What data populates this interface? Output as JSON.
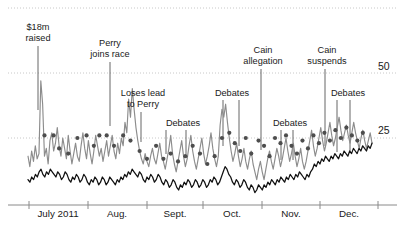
{
  "chart_data": {
    "type": "line",
    "title": "",
    "subtitle": "",
    "xlabel": "",
    "ylabel": "",
    "xlim": [
      0,
      186
    ],
    "ylim": [
      0,
      60
    ],
    "grid": true,
    "legend_position": "none",
    "x_tick_labels": [
      "July 2011",
      "Aug.",
      "Sept.",
      "Oct.",
      "Nov.",
      "Dec."
    ],
    "x_tick_positions_px": [
      29,
      88,
      147,
      203,
      262,
      320,
      378
    ],
    "y_tick_labels": [
      "50",
      "25"
    ],
    "y_tick_values": [
      50,
      25
    ],
    "gridlines": [
      75,
      50,
      25
    ],
    "colors": {
      "series_gray": "#8c8c8c",
      "series_black": "#111111",
      "dots": "#4d4d4d",
      "gridline": "#c8c8c8",
      "axis": "#8a8a8a",
      "leader": "#555555",
      "text": "#1a1a1a"
    },
    "series": [
      {
        "name": "gray-volatile-line",
        "color": "#8c8c8c",
        "style": "line",
        "values": [
          18,
          14,
          20,
          16,
          22,
          17,
          19,
          47,
          38,
          18,
          21,
          15,
          24,
          27,
          20,
          23,
          29,
          22,
          18,
          25,
          21,
          17,
          26,
          20,
          15,
          19,
          23,
          18,
          16,
          22,
          27,
          21,
          17,
          24,
          19,
          15,
          20,
          26,
          22,
          18,
          21,
          16,
          20,
          24,
          18,
          22,
          26,
          20,
          17,
          23,
          19,
          25,
          22,
          31,
          27,
          40,
          33,
          44,
          36,
          29,
          24,
          20,
          17,
          15,
          19,
          16,
          14,
          18,
          21,
          17,
          15,
          19,
          23,
          18,
          16,
          13,
          17,
          21,
          26,
          19,
          15,
          12,
          16,
          20,
          24,
          18,
          14,
          17,
          22,
          26,
          20,
          16,
          13,
          17,
          21,
          25,
          19,
          15,
          18,
          22,
          27,
          21,
          17,
          14,
          18,
          30,
          36,
          33,
          38,
          31,
          25,
          20,
          16,
          19,
          23,
          18,
          14,
          17,
          21,
          16,
          13,
          17,
          20,
          15,
          12,
          9,
          13,
          16,
          12,
          9,
          13,
          17,
          20,
          16,
          13,
          17,
          21,
          18,
          14,
          17,
          21,
          25,
          20,
          16,
          19,
          23,
          18,
          14,
          17,
          21,
          16,
          13,
          16,
          20,
          24,
          28,
          22,
          18,
          21,
          25,
          29,
          24,
          20,
          23,
          27,
          31,
          26,
          22,
          25,
          29,
          33,
          28,
          24,
          27,
          30,
          26,
          23,
          27,
          31,
          27,
          24,
          21,
          25,
          28,
          24,
          21,
          24,
          27,
          23
        ]
      },
      {
        "name": "black-line",
        "color": "#111111",
        "style": "line",
        "values": [
          9,
          8,
          10,
          9,
          11,
          10,
          12,
          13,
          11,
          10,
          12,
          11,
          13,
          12,
          11,
          10,
          12,
          11,
          9,
          10,
          12,
          11,
          9,
          8,
          10,
          9,
          11,
          10,
          8,
          9,
          11,
          10,
          8,
          7,
          9,
          8,
          10,
          9,
          7,
          8,
          10,
          9,
          7,
          8,
          10,
          9,
          8,
          7,
          9,
          8,
          10,
          9,
          11,
          10,
          12,
          11,
          13,
          12,
          11,
          10,
          12,
          11,
          9,
          8,
          10,
          9,
          11,
          10,
          8,
          9,
          11,
          10,
          8,
          7,
          9,
          8,
          6,
          7,
          9,
          8,
          6,
          5,
          7,
          6,
          8,
          7,
          9,
          8,
          6,
          7,
          9,
          8,
          6,
          7,
          9,
          8,
          6,
          7,
          9,
          8,
          10,
          9,
          7,
          8,
          10,
          12,
          14,
          13,
          11,
          10,
          8,
          7,
          9,
          8,
          6,
          7,
          9,
          8,
          6,
          5,
          7,
          6,
          4,
          5,
          7,
          6,
          5,
          7,
          6,
          8,
          7,
          9,
          8,
          7,
          9,
          8,
          10,
          9,
          8,
          10,
          9,
          11,
          10,
          9,
          11,
          10,
          12,
          11,
          10,
          9,
          11,
          10,
          12,
          13,
          15,
          14,
          16,
          15,
          17,
          16,
          18,
          17,
          16,
          18,
          17,
          19,
          18,
          17,
          19,
          18,
          20,
          19,
          18,
          20,
          19,
          21,
          20,
          19,
          21,
          20,
          22,
          21,
          20,
          22,
          21,
          23
        ]
      },
      {
        "name": "poll-dots",
        "color": "#4d4d4d",
        "style": "scatter",
        "points": [
          [
            9,
            26
          ],
          [
            14,
            26
          ],
          [
            17,
            21
          ],
          [
            22,
            19
          ],
          [
            27,
            25
          ],
          [
            32,
            26
          ],
          [
            36,
            22
          ],
          [
            39,
            26
          ],
          [
            43,
            26
          ],
          [
            47,
            22
          ],
          [
            52,
            26
          ],
          [
            56,
            24
          ],
          [
            61,
            20
          ],
          [
            65,
            17
          ],
          [
            70,
            22
          ],
          [
            74,
            17
          ],
          [
            78,
            19
          ],
          [
            82,
            16
          ],
          [
            86,
            18
          ],
          [
            90,
            22
          ],
          [
            94,
            19
          ],
          [
            98,
            15
          ],
          [
            102,
            18
          ],
          [
            106,
            25
          ],
          [
            110,
            27
          ],
          [
            113,
            23
          ],
          [
            116,
            20
          ],
          [
            119,
            25
          ],
          [
            122,
            19
          ],
          [
            126,
            24
          ],
          [
            129,
            22
          ],
          [
            132,
            18
          ],
          [
            135,
            25
          ],
          [
            138,
            23
          ],
          [
            141,
            26
          ],
          [
            144,
            22
          ],
          [
            147,
            19
          ],
          [
            150,
            24
          ],
          [
            153,
            21
          ],
          [
            156,
            26
          ],
          [
            159,
            23
          ],
          [
            162,
            27
          ],
          [
            165,
            24
          ],
          [
            168,
            28
          ],
          [
            171,
            25
          ],
          [
            174,
            29
          ],
          [
            177,
            26
          ],
          [
            180,
            24
          ],
          [
            183,
            27
          ]
        ]
      }
    ],
    "annotations": [
      {
        "label": "$18m\nraised",
        "x_px": 38,
        "text_x_px": 38,
        "text_y_px": 22,
        "leader_top_px": 46,
        "leader_bottom_px": 110
      },
      {
        "label": "Perry\njoins race",
        "x_px": 110,
        "text_x_px": 110,
        "text_y_px": 38,
        "leader_top_px": 62,
        "leader_bottom_px": 126
      },
      {
        "label": "Loses lead\nto Perry",
        "x_px": 141,
        "text_x_px": 143,
        "text_y_px": 88,
        "leader_top_px": 112,
        "leader_bottom_px": 142
      },
      {
        "label": "Debates",
        "x_px": 166,
        "text_x_px": 183,
        "text_y_px": 118,
        "leader_top_px": 130,
        "leader_bottom_px": 154,
        "extra_leaders_px": [
          186
        ]
      },
      {
        "label": "Debates",
        "x_px": 223,
        "text_x_px": 232,
        "text_y_px": 88,
        "leader_top_px": 100,
        "leader_bottom_px": 146,
        "extra_leaders_px": [
          239
        ]
      },
      {
        "label": "Cain\nallegation",
        "x_px": 261,
        "text_x_px": 263,
        "text_y_px": 45,
        "leader_top_px": 69,
        "leader_bottom_px": 150
      },
      {
        "label": "Debates",
        "x_px": 281,
        "text_x_px": 290,
        "text_y_px": 118,
        "leader_top_px": 130,
        "leader_bottom_px": 160,
        "extra_leaders_px": [
          293
        ]
      },
      {
        "label": "Cain\nsuspends",
        "x_px": 325,
        "text_x_px": 327,
        "text_y_px": 45,
        "leader_top_px": 69,
        "leader_bottom_px": 146
      },
      {
        "label": "Debates",
        "x_px": 337,
        "text_x_px": 348,
        "text_y_px": 88,
        "leader_top_px": 100,
        "leader_bottom_px": 152,
        "extra_leaders_px": [
          350
        ]
      }
    ]
  },
  "axis": {
    "y_labels": [
      {
        "text": "50",
        "x_px": 378,
        "y_px": 60
      },
      {
        "text": "25",
        "x_px": 378,
        "y_px": 124
      }
    ],
    "x_labels": [
      {
        "text": "July 2011",
        "center_px": 58,
        "y_px": 208
      },
      {
        "text": "Aug.",
        "center_px": 117,
        "y_px": 208
      },
      {
        "text": "Sept.",
        "center_px": 175,
        "y_px": 208
      },
      {
        "text": "Oct.",
        "center_px": 232,
        "y_px": 208
      },
      {
        "text": "Nov.",
        "center_px": 291,
        "y_px": 208
      },
      {
        "text": "Dec.",
        "center_px": 349,
        "y_px": 208
      }
    ]
  }
}
